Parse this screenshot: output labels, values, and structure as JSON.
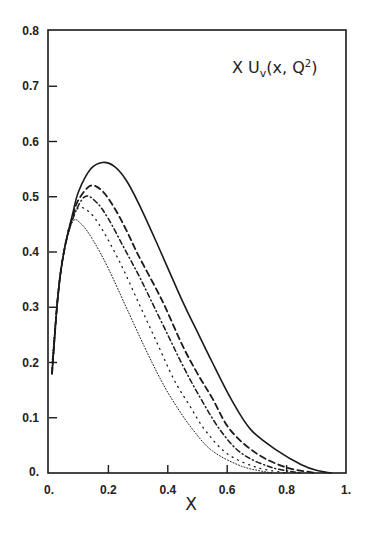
{
  "chart_data": {
    "type": "line",
    "title_parts": {
      "main": "X U",
      "sub": "v",
      "args": "(x, Q",
      "sup": "2",
      "close": ")"
    },
    "xlabel": "X",
    "ylabel": "",
    "xlim": [
      0,
      1
    ],
    "ylim": [
      0,
      0.8
    ],
    "grid": false,
    "legend": null,
    "x_ticks": [
      0,
      0.2,
      0.4,
      0.6,
      0.8,
      1.0
    ],
    "x_tick_labels": [
      "0.",
      "0.2",
      "0.4",
      "0.6",
      "0.8",
      "1."
    ],
    "y_ticks": [
      0,
      0.1,
      0.2,
      0.3,
      0.4,
      0.5,
      0.6,
      0.7,
      0.8
    ],
    "y_tick_labels": [
      "0.",
      "0.1",
      "0.2",
      "0.3",
      "0.4",
      "0.5",
      "0.6",
      "0.7",
      "0.8"
    ],
    "series": [
      {
        "name": "solid",
        "style": "solid",
        "width": 1.6,
        "dash": "",
        "x": [
          0.01,
          0.03,
          0.05,
          0.08,
          0.1,
          0.14,
          0.18,
          0.22,
          0.26,
          0.3,
          0.36,
          0.45,
          0.5,
          0.55,
          0.615,
          0.68,
          0.77,
          0.85,
          0.9,
          0.95
        ],
        "y": [
          0.18,
          0.32,
          0.4,
          0.47,
          0.51,
          0.55,
          0.562,
          0.555,
          0.53,
          0.49,
          0.42,
          0.31,
          0.255,
          0.2,
          0.132,
          0.078,
          0.04,
          0.015,
          0.005,
          0.0
        ]
      },
      {
        "name": "dashed",
        "style": "dashed",
        "width": 1.8,
        "dash": "6 4",
        "x": [
          0.01,
          0.03,
          0.05,
          0.08,
          0.1,
          0.14,
          0.18,
          0.22,
          0.26,
          0.3,
          0.38,
          0.45,
          0.5,
          0.55,
          0.61,
          0.7,
          0.8,
          0.9
        ],
        "y": [
          0.18,
          0.32,
          0.4,
          0.465,
          0.495,
          0.52,
          0.51,
          0.48,
          0.44,
          0.395,
          0.313,
          0.23,
          0.18,
          0.135,
          0.078,
          0.035,
          0.01,
          0.0
        ]
      },
      {
        "name": "long-dash-dot",
        "style": "dashdot",
        "width": 1.5,
        "dash": "5 3 1 3",
        "x": [
          0.01,
          0.03,
          0.05,
          0.08,
          0.12,
          0.16,
          0.2,
          0.25,
          0.3,
          0.343,
          0.4,
          0.45,
          0.5,
          0.576,
          0.65,
          0.75,
          0.85
        ],
        "y": [
          0.18,
          0.32,
          0.4,
          0.46,
          0.5,
          0.49,
          0.46,
          0.41,
          0.36,
          0.313,
          0.25,
          0.195,
          0.145,
          0.078,
          0.035,
          0.01,
          0.0
        ]
      },
      {
        "name": "sparse-dotted",
        "style": "dotted",
        "width": 1.3,
        "dash": "1 5",
        "x": [
          0.01,
          0.03,
          0.05,
          0.07,
          0.1,
          0.14,
          0.18,
          0.24,
          0.3,
          0.36,
          0.42,
          0.47,
          0.525,
          0.6,
          0.7,
          0.8
        ],
        "y": [
          0.19,
          0.32,
          0.4,
          0.45,
          0.48,
          0.47,
          0.44,
          0.38,
          0.31,
          0.24,
          0.17,
          0.125,
          0.078,
          0.035,
          0.01,
          0.0
        ]
      },
      {
        "name": "fine-dotted",
        "style": "dotted",
        "width": 1.0,
        "dash": "1 2",
        "x": [
          0.01,
          0.03,
          0.05,
          0.08,
          0.11,
          0.15,
          0.2,
          0.26,
          0.32,
          0.38,
          0.43,
          0.485,
          0.55,
          0.65,
          0.75
        ],
        "y": [
          0.2,
          0.32,
          0.4,
          0.455,
          0.45,
          0.42,
          0.37,
          0.3,
          0.23,
          0.165,
          0.12,
          0.078,
          0.04,
          0.012,
          0.0
        ]
      }
    ],
    "colors": {
      "line": "#1a1a1a",
      "axis": "#1a1a1a",
      "background": "#ffffff"
    }
  }
}
